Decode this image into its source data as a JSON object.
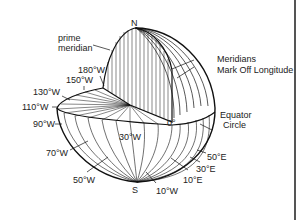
{
  "diagram": {
    "poles": {
      "north": "N",
      "south": "S"
    },
    "labels": {
      "prime_meridian_line1": "prime",
      "prime_meridian_line2": "meridian",
      "meridians_line1": "Meridians",
      "meridians_line2": "Mark Off Longitude",
      "equator_line1": "Equator",
      "equator_line2": "Circle",
      "zero": "0°"
    },
    "west_longitudes": [
      "180°W",
      "150°W",
      "130°W",
      "110°W",
      "90°W",
      "70°W",
      "50°W",
      "30°W",
      "10°W"
    ],
    "east_longitudes": [
      "10°E",
      "30°E",
      "50°E"
    ],
    "colors": {
      "line": "#111111",
      "text": "#222222",
      "background": "#ffffff",
      "frame_edge": "#555555"
    }
  }
}
